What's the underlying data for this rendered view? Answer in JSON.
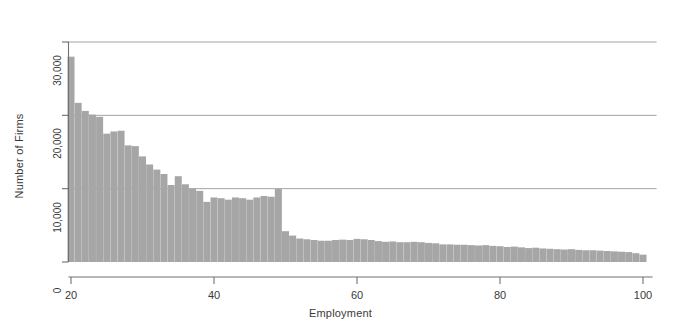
{
  "chart_data": {
    "type": "bar",
    "title": "",
    "subtitle": "",
    "xlabel": "Employment",
    "ylabel": "Number of Firms",
    "xlim": [
      19.5,
      100.5
    ],
    "ylim": [
      0,
      30000
    ],
    "grid": "horizontal",
    "legend": "none",
    "bar_color": "#a6a6a6",
    "axis_color": "#707070",
    "grid_color": "#9a9a9a",
    "text_color": "#3a3a3a",
    "background_color": "#ffffff",
    "xticks": [
      20,
      40,
      60,
      80,
      100
    ],
    "xtick_labels": [
      "20",
      "40",
      "60",
      "80",
      "100"
    ],
    "yticks": [
      0,
      10000,
      20000,
      30000
    ],
    "ytick_labels": [
      "0",
      "10,000",
      "20,000",
      "30,000"
    ],
    "categories": [
      20,
      21,
      22,
      23,
      24,
      25,
      26,
      27,
      28,
      29,
      30,
      31,
      32,
      33,
      34,
      35,
      36,
      37,
      38,
      39,
      40,
      41,
      42,
      43,
      44,
      45,
      46,
      47,
      48,
      49,
      50,
      51,
      52,
      53,
      54,
      55,
      56,
      57,
      58,
      59,
      60,
      61,
      62,
      63,
      64,
      65,
      66,
      67,
      68,
      69,
      70,
      71,
      72,
      73,
      74,
      75,
      76,
      77,
      78,
      79,
      80,
      81,
      82,
      83,
      84,
      85,
      86,
      87,
      88,
      89,
      90,
      91,
      92,
      93,
      94,
      95,
      96,
      97,
      98,
      99,
      100
    ],
    "values": [
      28000,
      21700,
      20600,
      20100,
      19800,
      17500,
      17800,
      17900,
      15900,
      15800,
      14400,
      13300,
      12600,
      12000,
      10500,
      11700,
      10600,
      10000,
      9700,
      8200,
      8800,
      8700,
      8500,
      8800,
      8700,
      8500,
      8800,
      9000,
      8900,
      10000,
      4200,
      3600,
      3200,
      3100,
      3000,
      2900,
      2900,
      3000,
      3050,
      3000,
      3150,
      3100,
      3000,
      2850,
      2750,
      2800,
      2700,
      2700,
      2750,
      2700,
      2600,
      2550,
      2400,
      2400,
      2350,
      2350,
      2300,
      2250,
      2300,
      2200,
      2150,
      2050,
      2100,
      2000,
      1900,
      1950,
      1850,
      1800,
      1750,
      1700,
      1750,
      1650,
      1600,
      1600,
      1550,
      1500,
      1450,
      1400,
      1350,
      1200,
      1000
    ]
  }
}
